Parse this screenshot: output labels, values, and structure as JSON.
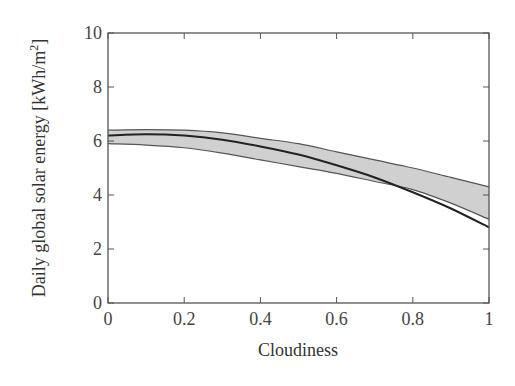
{
  "chart_data": {
    "type": "line",
    "title": "",
    "xlabel": "Cloudiness",
    "ylabel": "Daily global solar energy [kWh/m²]",
    "ylabel_main": "Daily global solar energy [kWh/m",
    "ylabel_sup": "2",
    "ylabel_end": "]",
    "xlim": [
      0,
      1
    ],
    "ylim": [
      0,
      10
    ],
    "x_ticks": [
      0,
      0.2,
      0.4,
      0.6,
      0.8,
      1
    ],
    "x_tick_labels": [
      "0",
      "0.2",
      "0.4",
      "0.6",
      "0.8",
      "1"
    ],
    "y_ticks": [
      0,
      2,
      4,
      6,
      8,
      10
    ],
    "y_tick_labels": [
      "0",
      "2",
      "4",
      "6",
      "8",
      "10"
    ],
    "grid": false,
    "legend": null,
    "x": [
      0,
      0.1,
      0.2,
      0.3,
      0.4,
      0.5,
      0.6,
      0.7,
      0.8,
      0.9,
      1.0
    ],
    "series": [
      {
        "name": "mean curve",
        "style": "line",
        "color": "#222222",
        "values": [
          6.2,
          6.25,
          6.2,
          6.05,
          5.8,
          5.5,
          5.1,
          4.65,
          4.1,
          3.5,
          2.8
        ]
      },
      {
        "name": "band upper bound",
        "style": "band-upper",
        "color": "#555555",
        "values": [
          6.4,
          6.42,
          6.4,
          6.3,
          6.1,
          5.9,
          5.6,
          5.3,
          5.0,
          4.65,
          4.3
        ]
      },
      {
        "name": "band lower bound",
        "style": "band-lower",
        "color": "#555555",
        "values": [
          5.9,
          5.85,
          5.75,
          5.55,
          5.3,
          5.05,
          4.8,
          4.5,
          4.2,
          3.7,
          3.1
        ]
      }
    ],
    "band_fill": "#d0d0d0"
  }
}
